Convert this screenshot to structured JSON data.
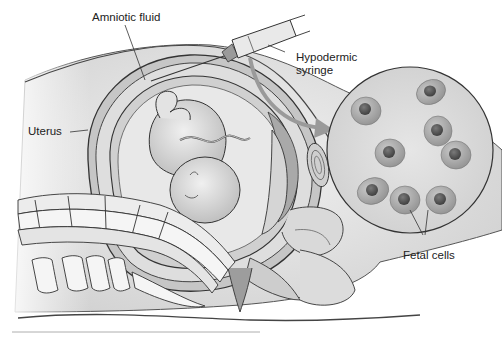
{
  "figure": {
    "labels": {
      "amniotic_fluid": "Amniotic fluid",
      "hypodermic_syringe_line1": "Hypodermic",
      "hypodermic_syringe_line2": "syringe",
      "uterus": "Uterus",
      "fetal_cells": "Fetal cells"
    },
    "magnified_view": {
      "cell_count": 8
    },
    "colors": {
      "line": "#333333",
      "fill_light": "#e6e6e6",
      "fill_mid": "#bdbdbd",
      "fill_dark": "#8c8c8c",
      "arrow": "#9a9a9a",
      "background": "#ffffff"
    }
  }
}
